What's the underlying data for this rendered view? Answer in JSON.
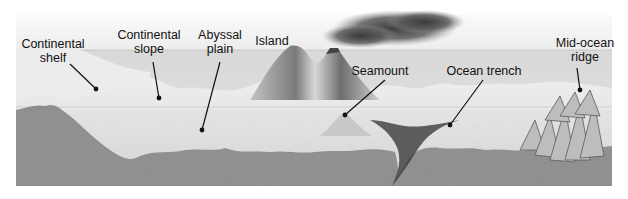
{
  "diagram": {
    "colors": {
      "sky": "#f3f3f3",
      "water": "#dedede",
      "seafloor_light": "#e8e8e8",
      "crust": "#8a8a8a",
      "smoke": "#4a4a4a",
      "label_text": "#111111",
      "pointer": "#111111"
    },
    "labels": [
      {
        "id": "continental-shelf",
        "lines": [
          "Continental",
          "shelf"
        ],
        "x": 53,
        "y": 37,
        "pointer": {
          "x1": 70,
          "y1": 64,
          "x2": 96,
          "y2": 89
        }
      },
      {
        "id": "continental-slope",
        "lines": [
          "Continental",
          "slope"
        ],
        "x": 149,
        "y": 28,
        "pointer": {
          "x1": 153,
          "y1": 62,
          "x2": 159,
          "y2": 98
        }
      },
      {
        "id": "abyssal-plain",
        "lines": [
          "Abyssal",
          "plain"
        ],
        "x": 220,
        "y": 28,
        "pointer": {
          "x1": 220,
          "y1": 62,
          "x2": 202,
          "y2": 130
        }
      },
      {
        "id": "island",
        "lines": [
          "Island"
        ],
        "x": 272,
        "y": 34,
        "pointer": null
      },
      {
        "id": "seamount",
        "lines": [
          "Seamount"
        ],
        "x": 380,
        "y": 64,
        "pointer": {
          "x1": 385,
          "y1": 80,
          "x2": 345,
          "y2": 115
        }
      },
      {
        "id": "ocean-trench",
        "lines": [
          "Ocean trench"
        ],
        "x": 484,
        "y": 64,
        "pointer": {
          "x1": 483,
          "y1": 80,
          "x2": 450,
          "y2": 125
        }
      },
      {
        "id": "mid-ocean-ridge",
        "lines": [
          "Mid-ocean",
          "ridge"
        ],
        "x": 585,
        "y": 36,
        "pointer": {
          "x1": 577,
          "y1": 68,
          "x2": 580,
          "y2": 90
        }
      }
    ]
  }
}
